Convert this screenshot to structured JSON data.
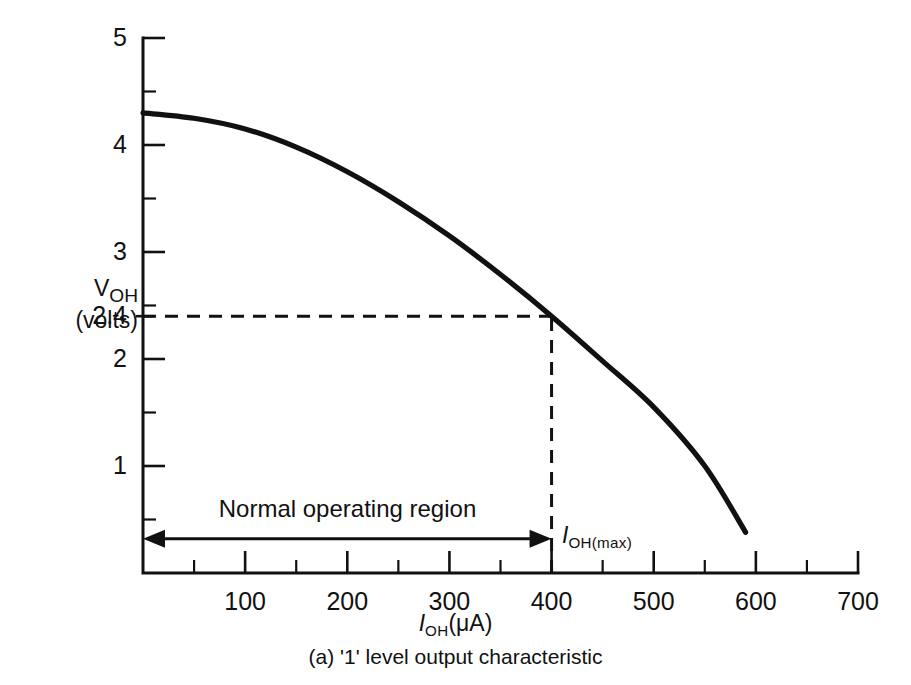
{
  "chart_data": {
    "type": "line",
    "title": "",
    "caption": "(a)  '1' level output characteristic",
    "xlabel_html": "<span class=\"it\">I</span><sub>OH</sub>(μA)",
    "ylabel_line1_html": "<span class=\"it\">V</span><sub>OH</sub>",
    "ylabel_line2": "(volts)",
    "xlabel_plain": "IOH(uA)",
    "ylabel_plain": "VOH (volts)",
    "xlim": [
      0,
      700
    ],
    "ylim": [
      0,
      5
    ],
    "grid": false,
    "legend": "none",
    "x_ticks_major": [
      0,
      100,
      200,
      300,
      400,
      500,
      600,
      700
    ],
    "x_tick_labels": [
      "",
      "100",
      "200",
      "300",
      "400",
      "500",
      "600",
      "700"
    ],
    "x_ticks_minor": [
      50,
      150,
      250,
      350,
      450,
      550,
      650
    ],
    "y_ticks_major": [
      1,
      2,
      3,
      4,
      5
    ],
    "y_tick_labels": [
      "1",
      "2",
      "3",
      "4",
      "5"
    ],
    "y_ticks_minor": [
      0.5,
      1.5,
      2.5,
      3.5,
      4.5
    ],
    "y_special_tick": 2.4,
    "y_special_label": "2.4",
    "series": [
      {
        "name": "1-level output characteristic",
        "x": [
          0,
          50,
          100,
          150,
          200,
          250,
          300,
          350,
          400,
          450,
          500,
          550,
          590
        ],
        "values": [
          4.3,
          4.25,
          4.15,
          3.98,
          3.75,
          3.47,
          3.15,
          2.79,
          2.4,
          1.98,
          1.55,
          1.0,
          0.38
        ]
      }
    ],
    "annotations": [
      {
        "name": "voh-min-guide",
        "type": "dashed-horizontal",
        "y": 2.4,
        "x_from": 0,
        "x_to": 400
      },
      {
        "name": "ioh-max-guide",
        "type": "dashed-vertical",
        "x": 400,
        "y_from": 0,
        "y_to": 2.4
      },
      {
        "name": "normal-operating-region",
        "type": "double-arrow",
        "label": "Normal operating region",
        "x_from": 0,
        "x_to": 400,
        "y": 0.32
      },
      {
        "name": "ioh-max-label",
        "type": "text",
        "label_html": "<span class=\"it\">I</span><sub>OH(max)</sub>",
        "label_plain": "IOH(max)",
        "x": 400,
        "y": 0.45
      }
    ],
    "colors": {
      "curve": "#111111",
      "axis": "#111111",
      "background": "#ffffff"
    }
  }
}
